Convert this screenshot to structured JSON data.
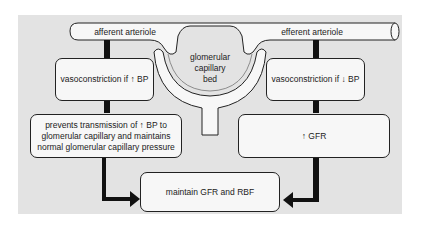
{
  "diagram": {
    "vessels": {
      "afferent": "afferent arteriole",
      "efferent": "efferent arteriole",
      "glomerulus": [
        "glomerular",
        "capillary",
        "bed"
      ]
    },
    "left_branch": {
      "step1": "vasoconstriction if ↑ BP",
      "step2": [
        "prevents transmission of ↑ BP to",
        "glomerular capillary and maintains",
        "normal glomerular capillary pressure"
      ]
    },
    "right_branch": {
      "step1": "vasoconstriction if ↓ BP",
      "step2": "↑ GFR"
    },
    "outcome": "maintain GFR and RBF",
    "colors": {
      "panel": "#e3e3e3",
      "box": "#f7f7f7",
      "line": "#222222"
    }
  }
}
